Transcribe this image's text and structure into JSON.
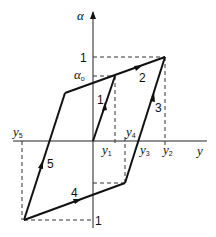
{
  "diagram": {
    "type": "hysteresis-loop",
    "axes": {
      "x_label": "y",
      "y_label": "α"
    },
    "y_ticks": {
      "top": "1",
      "alpha0_base": "α",
      "alpha0_sub": "o",
      "bottom": "1"
    },
    "x_markers": [
      {
        "base": "y",
        "sub": "5"
      },
      {
        "base": "y",
        "sub": "1"
      },
      {
        "base": "y",
        "sub": "4"
      },
      {
        "base": "y",
        "sub": "3"
      },
      {
        "base": "y",
        "sub": "2"
      }
    ],
    "segments": [
      {
        "label": "1",
        "description": "origin to α0"
      },
      {
        "label": "2",
        "description": "α0 to upper-right corner"
      },
      {
        "label": "3",
        "description": "y3 up to upper-right corner"
      },
      {
        "label": "4",
        "description": "lower-left to lower-right corner"
      },
      {
        "label": "5",
        "description": "lower-left corner up to upper-left"
      }
    ],
    "colors": {
      "line": "#111111",
      "background": "#ffffff"
    }
  }
}
